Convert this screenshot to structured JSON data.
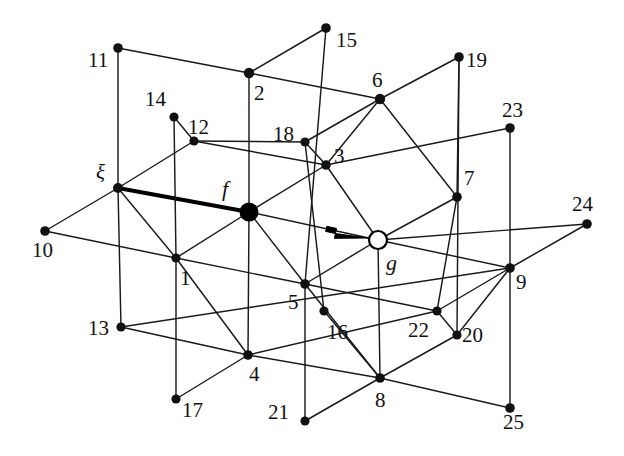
{
  "figure": {
    "background_color": "#ffffff",
    "ink_color": "#111111",
    "width": 624,
    "height": 456
  },
  "diagram_data": {
    "type": "diagram",
    "description": "Isometric 3x3x3 cubic lattice graph with numbered sites, an origin site xi, a filled source site f joined to xi by a thick bold edge, and a hollow target site g indicated by an arrow",
    "projection": {
      "axis_a_step_px": [
        65,
        12
      ],
      "axis_b_step_px": [
        56,
        -69
      ],
      "axis_c_step_px": [
        0,
        70
      ]
    },
    "node_count": 28,
    "nodes": [
      {
        "id": "xi",
        "label": "ξ",
        "x": 118,
        "y": 188,
        "style": "filled",
        "radius": 5.0,
        "label_x": 96,
        "label_y": 162,
        "label_class": "greek"
      },
      {
        "id": "f",
        "label": "f",
        "x": 249,
        "y": 212,
        "style": "big",
        "radius": 9.5,
        "label_x": 222,
        "label_y": 178,
        "label_class": "italic"
      },
      {
        "id": "g",
        "label": "g",
        "x": 378,
        "y": 240,
        "style": "hollow",
        "radius": 9.0,
        "label_x": 386,
        "label_y": 252,
        "label_class": "italic"
      },
      {
        "id": "n1",
        "label": "1",
        "x": 176,
        "y": 258,
        "style": "filled",
        "radius": 4.6,
        "label_x": 180,
        "label_y": 268,
        "label_class": ""
      },
      {
        "id": "n2",
        "label": "2",
        "x": 249,
        "y": 73,
        "style": "filled",
        "radius": 5.2,
        "label_x": 254,
        "label_y": 83,
        "label_class": ""
      },
      {
        "id": "n3",
        "label": "3",
        "x": 326,
        "y": 165,
        "style": "filled",
        "radius": 4.8,
        "label_x": 334,
        "label_y": 146,
        "label_class": ""
      },
      {
        "id": "n4",
        "label": "4",
        "x": 248,
        "y": 355,
        "style": "filled",
        "radius": 4.8,
        "label_x": 249,
        "label_y": 364,
        "label_class": ""
      },
      {
        "id": "n5",
        "label": "5",
        "x": 305,
        "y": 284,
        "style": "filled",
        "radius": 4.8,
        "label_x": 288,
        "label_y": 292,
        "label_class": ""
      },
      {
        "id": "n6",
        "label": "6",
        "x": 380,
        "y": 99,
        "style": "filled",
        "radius": 5.2,
        "label_x": 372,
        "label_y": 70,
        "label_class": ""
      },
      {
        "id": "n7",
        "label": "7",
        "x": 457,
        "y": 197,
        "style": "filled",
        "radius": 4.8,
        "label_x": 464,
        "label_y": 168,
        "label_class": ""
      },
      {
        "id": "n8",
        "label": "8",
        "x": 380,
        "y": 378,
        "style": "filled",
        "radius": 4.8,
        "label_x": 375,
        "label_y": 390,
        "label_class": ""
      },
      {
        "id": "n9",
        "label": "9",
        "x": 510,
        "y": 268,
        "style": "filled",
        "radius": 4.8,
        "label_x": 516,
        "label_y": 272,
        "label_class": ""
      },
      {
        "id": "n10",
        "label": "10",
        "x": 45,
        "y": 231,
        "style": "filled",
        "radius": 4.8,
        "label_x": 32,
        "label_y": 240,
        "label_class": ""
      },
      {
        "id": "n11",
        "label": "11",
        "x": 118,
        "y": 48,
        "style": "filled",
        "radius": 4.8,
        "label_x": 88,
        "label_y": 50,
        "label_class": ""
      },
      {
        "id": "n12",
        "label": "12",
        "x": 194,
        "y": 141,
        "style": "filled",
        "radius": 4.6,
        "label_x": 188,
        "label_y": 117,
        "label_class": ""
      },
      {
        "id": "n13",
        "label": "13",
        "x": 121,
        "y": 327,
        "style": "filled",
        "radius": 4.6,
        "label_x": 88,
        "label_y": 318,
        "label_class": ""
      },
      {
        "id": "n14",
        "label": "14",
        "x": 174,
        "y": 117,
        "style": "filled",
        "radius": 4.6,
        "label_x": 145,
        "label_y": 89,
        "label_class": ""
      },
      {
        "id": "n15",
        "label": "15",
        "x": 326,
        "y": 28,
        "style": "filled",
        "radius": 4.8,
        "label_x": 336,
        "label_y": 30,
        "label_class": ""
      },
      {
        "id": "n16",
        "label": "16",
        "x": 324,
        "y": 311,
        "style": "filled",
        "radius": 4.6,
        "label_x": 327,
        "label_y": 322,
        "label_class": ""
      },
      {
        "id": "n17",
        "label": "17",
        "x": 176,
        "y": 399,
        "style": "filled",
        "radius": 4.6,
        "label_x": 182,
        "label_y": 400,
        "label_class": ""
      },
      {
        "id": "n18",
        "label": "18",
        "x": 305,
        "y": 142,
        "style": "filled",
        "radius": 4.6,
        "label_x": 273,
        "label_y": 124,
        "label_class": ""
      },
      {
        "id": "n19",
        "label": "19",
        "x": 459,
        "y": 57,
        "style": "filled",
        "radius": 4.8,
        "label_x": 466,
        "label_y": 50,
        "label_class": ""
      },
      {
        "id": "n20",
        "label": "20",
        "x": 457,
        "y": 335,
        "style": "filled",
        "radius": 4.6,
        "label_x": 462,
        "label_y": 325,
        "label_class": ""
      },
      {
        "id": "n21",
        "label": "21",
        "x": 305,
        "y": 421,
        "style": "filled",
        "radius": 4.6,
        "label_x": 268,
        "label_y": 402,
        "label_class": ""
      },
      {
        "id": "n22",
        "label": "22",
        "x": 437,
        "y": 311,
        "style": "filled",
        "radius": 4.6,
        "label_x": 408,
        "label_y": 320,
        "label_class": ""
      },
      {
        "id": "n23",
        "label": "23",
        "x": 510,
        "y": 128,
        "style": "filled",
        "radius": 4.8,
        "label_x": 502,
        "label_y": 100,
        "label_class": ""
      },
      {
        "id": "n24",
        "label": "24",
        "x": 587,
        "y": 224,
        "style": "filled",
        "radius": 4.8,
        "label_x": 572,
        "label_y": 194,
        "label_class": ""
      },
      {
        "id": "n25",
        "label": "25",
        "x": 510,
        "y": 408,
        "style": "filled",
        "radius": 4.8,
        "label_x": 503,
        "label_y": 412,
        "label_class": ""
      }
    ],
    "edges": [
      {
        "from": "n11",
        "to": "n2",
        "style": "thin"
      },
      {
        "from": "n2",
        "to": "n6",
        "style": "thin"
      },
      {
        "from": "n6",
        "to": "n19",
        "style": "thin"
      },
      {
        "from": "n14",
        "to": "n12",
        "style": "thin"
      },
      {
        "from": "n12",
        "to": "n18",
        "style": "thin"
      },
      {
        "from": "n18",
        "to": "n6",
        "style": "thin"
      },
      {
        "from": "n12",
        "to": "n3",
        "style": "thin"
      },
      {
        "from": "n3",
        "to": "n23",
        "style": "thin"
      },
      {
        "from": "xi",
        "to": "n12",
        "style": "thin"
      },
      {
        "from": "n10",
        "to": "xi",
        "style": "thin"
      },
      {
        "from": "xi",
        "to": "f",
        "style": "thick"
      },
      {
        "from": "f",
        "to": "g",
        "style": "thin"
      },
      {
        "from": "g",
        "to": "n24",
        "style": "thin"
      },
      {
        "from": "n10",
        "to": "n1",
        "style": "thin"
      },
      {
        "from": "n1",
        "to": "n5",
        "style": "thin"
      },
      {
        "from": "n5",
        "to": "n22",
        "style": "thin"
      },
      {
        "from": "n1",
        "to": "f",
        "style": "thin"
      },
      {
        "from": "f",
        "to": "n3",
        "style": "thin"
      },
      {
        "from": "n3",
        "to": "n6",
        "style": "thin"
      },
      {
        "from": "n5",
        "to": "g",
        "style": "thin"
      },
      {
        "from": "g",
        "to": "n7",
        "style": "thin"
      },
      {
        "from": "n7",
        "to": "n19",
        "style": "thin"
      },
      {
        "from": "n13",
        "to": "n4",
        "style": "thin"
      },
      {
        "from": "n4",
        "to": "n8",
        "style": "thin"
      },
      {
        "from": "n8",
        "to": "n25",
        "style": "thin"
      },
      {
        "from": "n17",
        "to": "n4",
        "style": "thin"
      },
      {
        "from": "n4",
        "to": "n1",
        "style": "thin"
      },
      {
        "from": "n1",
        "to": "xi",
        "style": "thin"
      },
      {
        "from": "n21",
        "to": "n8",
        "style": "thin"
      },
      {
        "from": "n8",
        "to": "n5",
        "style": "thin"
      },
      {
        "from": "n5",
        "to": "f",
        "style": "thin"
      },
      {
        "from": "n20",
        "to": "n9",
        "style": "thin"
      },
      {
        "from": "n9",
        "to": "g",
        "style": "thin"
      },
      {
        "from": "n22",
        "to": "n9",
        "style": "thin"
      },
      {
        "from": "n9",
        "to": "n24",
        "style": "thin"
      },
      {
        "from": "n4",
        "to": "n22",
        "style": "thin"
      },
      {
        "from": "n8",
        "to": "n20",
        "style": "thin"
      },
      {
        "from": "n13",
        "to": "n9",
        "style": "thin"
      },
      {
        "from": "n11",
        "to": "xi",
        "style": "thin"
      },
      {
        "from": "xi",
        "to": "n13",
        "style": "thin"
      },
      {
        "from": "n14",
        "to": "n1",
        "style": "thin"
      },
      {
        "from": "n1",
        "to": "n17",
        "style": "thin"
      },
      {
        "from": "n2",
        "to": "f",
        "style": "thin"
      },
      {
        "from": "f",
        "to": "n4",
        "style": "thin"
      },
      {
        "from": "n15",
        "to": "n5",
        "style": "thin"
      },
      {
        "from": "n5",
        "to": "n21",
        "style": "thin"
      },
      {
        "from": "n18",
        "to": "n16",
        "style": "thin"
      },
      {
        "from": "n3",
        "to": "g",
        "style": "thin"
      },
      {
        "from": "g",
        "to": "n8",
        "style": "thin"
      },
      {
        "from": "n6",
        "to": "n7",
        "style": "thin"
      },
      {
        "from": "n7",
        "to": "n22",
        "style": "thin"
      },
      {
        "from": "n19",
        "to": "n20",
        "style": "thin"
      },
      {
        "from": "n23",
        "to": "n9",
        "style": "thin"
      },
      {
        "from": "n9",
        "to": "n25",
        "style": "thin"
      },
      {
        "from": "n2",
        "to": "n15",
        "style": "thin"
      },
      {
        "from": "n18",
        "to": "n3",
        "style": "thin"
      },
      {
        "from": "n16",
        "to": "n8",
        "style": "thin"
      },
      {
        "from": "n22",
        "to": "n20",
        "style": "thin"
      }
    ],
    "arrow": {
      "name": "incoming-arrow-to-g",
      "tail_x": 336,
      "tail_y": 231,
      "tip_x": 368,
      "tip_y": 238
    },
    "special_markers": {
      "origin_site": "ξ",
      "source_site": "f",
      "target_site": "g",
      "bold_edge": "xi-to-f"
    }
  }
}
